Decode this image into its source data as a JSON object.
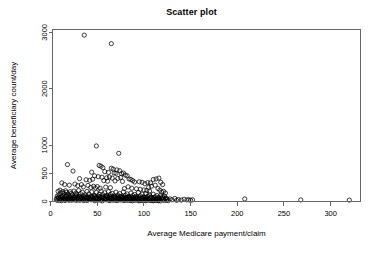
{
  "chart_data": {
    "type": "scatter",
    "title": "Scatter plot",
    "xlabel": "Average Medicare payment/claim",
    "ylabel": "Average beneficiary count/day",
    "xlim": [
      2,
      332
    ],
    "ylim": [
      0,
      3050
    ],
    "xticks": [
      0,
      50,
      100,
      150,
      200,
      250,
      300
    ],
    "xtick_labels": [
      "0",
      "50",
      "100",
      "150",
      "200",
      "250",
      "300"
    ],
    "yticks": [
      0,
      500,
      1000,
      2000,
      3000
    ],
    "ytick_labels": [
      "0",
      "500",
      "1000",
      "2000",
      "3000"
    ],
    "grid": false,
    "legend": null,
    "marker": "open-circle",
    "marker_color": "#000000",
    "marker_radius": 2.1,
    "points": [
      [
        36,
        2950
      ],
      [
        65,
        2800
      ],
      [
        49,
        985
      ],
      [
        73,
        855
      ],
      [
        18,
        655
      ],
      [
        52,
        640
      ],
      [
        54,
        625
      ],
      [
        56,
        600
      ],
      [
        65,
        590
      ],
      [
        67,
        575
      ],
      [
        71,
        560
      ],
      [
        74,
        545
      ],
      [
        24,
        540
      ],
      [
        44,
        520
      ],
      [
        58,
        530
      ],
      [
        62,
        515
      ],
      [
        68,
        505
      ],
      [
        70,
        500
      ],
      [
        76,
        495
      ],
      [
        78,
        505
      ],
      [
        80,
        470
      ],
      [
        82,
        455
      ],
      [
        47,
        455
      ],
      [
        51,
        440
      ],
      [
        55,
        430
      ],
      [
        60,
        420
      ],
      [
        63,
        435
      ],
      [
        66,
        415
      ],
      [
        72,
        410
      ],
      [
        75,
        425
      ],
      [
        84,
        400
      ],
      [
        86,
        390
      ],
      [
        31,
        405
      ],
      [
        38,
        385
      ],
      [
        42,
        375
      ],
      [
        45,
        395
      ],
      [
        57,
        370
      ],
      [
        61,
        360
      ],
      [
        69,
        365
      ],
      [
        77,
        355
      ],
      [
        88,
        370
      ],
      [
        90,
        345
      ],
      [
        95,
        350
      ],
      [
        98,
        340
      ],
      [
        104,
        335
      ],
      [
        110,
        390
      ],
      [
        113,
        400
      ],
      [
        116,
        415
      ],
      [
        107,
        330
      ],
      [
        101,
        315
      ],
      [
        118,
        340
      ],
      [
        120,
        300
      ],
      [
        112,
        290
      ],
      [
        108,
        270
      ],
      [
        105,
        250
      ],
      [
        115,
        230
      ],
      [
        117,
        200
      ],
      [
        121,
        180
      ],
      [
        123,
        150
      ],
      [
        119,
        165
      ],
      [
        12,
        330
      ],
      [
        15,
        300
      ],
      [
        20,
        290
      ],
      [
        26,
        310
      ],
      [
        29,
        280
      ],
      [
        33,
        300
      ],
      [
        35,
        260
      ],
      [
        40,
        285
      ],
      [
        43,
        250
      ],
      [
        46,
        270
      ],
      [
        48,
        240
      ],
      [
        50,
        265
      ],
      [
        53,
        235
      ],
      [
        59,
        255
      ],
      [
        64,
        245
      ],
      [
        79,
        230
      ],
      [
        83,
        260
      ],
      [
        87,
        235
      ],
      [
        92,
        225
      ],
      [
        96,
        215
      ],
      [
        100,
        205
      ],
      [
        103,
        195
      ],
      [
        106,
        185
      ],
      [
        8,
        180
      ],
      [
        10,
        200
      ],
      [
        11,
        155
      ],
      [
        13,
        175
      ],
      [
        14,
        140
      ],
      [
        16,
        190
      ],
      [
        17,
        160
      ],
      [
        19,
        130
      ],
      [
        21,
        175
      ],
      [
        22,
        145
      ],
      [
        23,
        120
      ],
      [
        25,
        185
      ],
      [
        27,
        150
      ],
      [
        28,
        125
      ],
      [
        30,
        195
      ],
      [
        32,
        140
      ],
      [
        34,
        165
      ],
      [
        37,
        115
      ],
      [
        39,
        180
      ],
      [
        41,
        135
      ],
      [
        44,
        170
      ],
      [
        47,
        110
      ],
      [
        49,
        160
      ],
      [
        52,
        130
      ],
      [
        54,
        185
      ],
      [
        56,
        120
      ],
      [
        58,
        155
      ],
      [
        60,
        105
      ],
      [
        62,
        175
      ],
      [
        64,
        125
      ],
      [
        66,
        145
      ],
      [
        68,
        100
      ],
      [
        70,
        165
      ],
      [
        72,
        115
      ],
      [
        74,
        140
      ],
      [
        76,
        95
      ],
      [
        78,
        170
      ],
      [
        80,
        110
      ],
      [
        82,
        135
      ],
      [
        84,
        90
      ],
      [
        86,
        150
      ],
      [
        88,
        105
      ],
      [
        90,
        125
      ],
      [
        92,
        85
      ],
      [
        94,
        160
      ],
      [
        96,
        100
      ],
      [
        98,
        130
      ],
      [
        100,
        80
      ],
      [
        102,
        140
      ],
      [
        104,
        95
      ],
      [
        106,
        115
      ],
      [
        108,
        75
      ],
      [
        110,
        130
      ],
      [
        112,
        85
      ],
      [
        114,
        105
      ],
      [
        116,
        70
      ],
      [
        118,
        110
      ],
      [
        120,
        80
      ],
      [
        122,
        95
      ],
      [
        124,
        60
      ],
      [
        7,
        95
      ],
      [
        8,
        60
      ],
      [
        9,
        120
      ],
      [
        10,
        45
      ],
      [
        11,
        80
      ],
      [
        12,
        35
      ],
      [
        13,
        100
      ],
      [
        14,
        55
      ],
      [
        15,
        70
      ],
      [
        16,
        30
      ],
      [
        17,
        110
      ],
      [
        18,
        50
      ],
      [
        19,
        85
      ],
      [
        20,
        40
      ],
      [
        21,
        65
      ],
      [
        22,
        25
      ],
      [
        23,
        95
      ],
      [
        24,
        55
      ],
      [
        25,
        75
      ],
      [
        26,
        35
      ],
      [
        27,
        105
      ],
      [
        28,
        45
      ],
      [
        29,
        70
      ],
      [
        30,
        28
      ],
      [
        31,
        90
      ],
      [
        32,
        52
      ],
      [
        33,
        68
      ],
      [
        34,
        32
      ],
      [
        35,
        98
      ],
      [
        36,
        42
      ],
      [
        37,
        72
      ],
      [
        38,
        26
      ],
      [
        39,
        86
      ],
      [
        40,
        56
      ],
      [
        41,
        64
      ],
      [
        42,
        36
      ],
      [
        43,
        92
      ],
      [
        44,
        46
      ],
      [
        45,
        76
      ],
      [
        46,
        30
      ],
      [
        47,
        88
      ],
      [
        48,
        58
      ],
      [
        49,
        66
      ],
      [
        50,
        38
      ],
      [
        51,
        94
      ],
      [
        52,
        48
      ],
      [
        53,
        74
      ],
      [
        54,
        28
      ],
      [
        55,
        84
      ],
      [
        56,
        54
      ],
      [
        57,
        62
      ],
      [
        58,
        34
      ],
      [
        59,
        90
      ],
      [
        60,
        44
      ],
      [
        61,
        78
      ],
      [
        62,
        24
      ],
      [
        63,
        82
      ],
      [
        64,
        52
      ],
      [
        65,
        60
      ],
      [
        66,
        32
      ],
      [
        67,
        88
      ],
      [
        68,
        42
      ],
      [
        69,
        70
      ],
      [
        70,
        22
      ],
      [
        71,
        80
      ],
      [
        72,
        50
      ],
      [
        73,
        58
      ],
      [
        74,
        30
      ],
      [
        75,
        86
      ],
      [
        76,
        40
      ],
      [
        77,
        68
      ],
      [
        78,
        20
      ],
      [
        79,
        78
      ],
      [
        80,
        48
      ],
      [
        81,
        56
      ],
      [
        82,
        28
      ],
      [
        83,
        84
      ],
      [
        84,
        38
      ],
      [
        85,
        66
      ],
      [
        86,
        18
      ],
      [
        87,
        76
      ],
      [
        88,
        46
      ],
      [
        89,
        54
      ],
      [
        90,
        26
      ],
      [
        91,
        82
      ],
      [
        92,
        36
      ],
      [
        93,
        64
      ],
      [
        94,
        16
      ],
      [
        95,
        74
      ],
      [
        96,
        44
      ],
      [
        97,
        52
      ],
      [
        98,
        24
      ],
      [
        99,
        80
      ],
      [
        100,
        34
      ],
      [
        101,
        62
      ],
      [
        102,
        14
      ],
      [
        103,
        72
      ],
      [
        104,
        42
      ],
      [
        105,
        50
      ],
      [
        106,
        22
      ],
      [
        107,
        78
      ],
      [
        108,
        32
      ],
      [
        109,
        60
      ],
      [
        110,
        12
      ],
      [
        111,
        70
      ],
      [
        112,
        40
      ],
      [
        113,
        48
      ],
      [
        114,
        20
      ],
      [
        115,
        66
      ],
      [
        116,
        30
      ],
      [
        117,
        56
      ],
      [
        118,
        10
      ],
      [
        119,
        62
      ],
      [
        120,
        36
      ],
      [
        121,
        44
      ],
      [
        122,
        18
      ],
      [
        123,
        52
      ],
      [
        124,
        26
      ],
      [
        125,
        40
      ],
      [
        126,
        14
      ],
      [
        6,
        30
      ],
      [
        6.5,
        55
      ],
      [
        7.5,
        20
      ],
      [
        8.5,
        75
      ],
      [
        9.5,
        25
      ],
      [
        10.5,
        65
      ],
      [
        11.5,
        15
      ],
      [
        12.5,
        88
      ],
      [
        13.5,
        33
      ],
      [
        14.5,
        48
      ],
      [
        15.5,
        18
      ],
      [
        16.5,
        96
      ],
      [
        17.5,
        38
      ],
      [
        18.5,
        58
      ],
      [
        19.5,
        22
      ],
      [
        20.5,
        78
      ],
      [
        21.5,
        43
      ],
      [
        22.5,
        53
      ],
      [
        23.5,
        27
      ],
      [
        24.5,
        68
      ],
      [
        25.5,
        31
      ],
      [
        26.5,
        83
      ],
      [
        27.5,
        19
      ],
      [
        28.5,
        61
      ],
      [
        29.5,
        37
      ],
      [
        30.5,
        91
      ],
      [
        31.5,
        23
      ],
      [
        32.5,
        71
      ],
      [
        33.5,
        41
      ],
      [
        34.5,
        59
      ],
      [
        35.5,
        17
      ],
      [
        36.5,
        81
      ],
      [
        37.5,
        35
      ],
      [
        38.5,
        63
      ],
      [
        39.5,
        21
      ],
      [
        40.5,
        73
      ],
      [
        41.5,
        45
      ],
      [
        42.5,
        51
      ],
      [
        43.5,
        29
      ],
      [
        44.5,
        85
      ],
      [
        45.5,
        39
      ],
      [
        46.5,
        57
      ],
      [
        47.5,
        13
      ],
      [
        48.5,
        67
      ],
      [
        49.5,
        47
      ],
      [
        50.5,
        49
      ],
      [
        51.5,
        25
      ],
      [
        52.5,
        87
      ],
      [
        53.5,
        33
      ],
      [
        54.5,
        69
      ],
      [
        55.5,
        11
      ],
      [
        56.5,
        77
      ],
      [
        57.5,
        41
      ],
      [
        58.5,
        55
      ],
      [
        59.5,
        29
      ],
      [
        60.5,
        79
      ],
      [
        61.5,
        37
      ],
      [
        62.5,
        65
      ],
      [
        63.5,
        15
      ],
      [
        64.5,
        89
      ],
      [
        65.5,
        43
      ],
      [
        66.5,
        53
      ],
      [
        67.5,
        23
      ],
      [
        68.5,
        75
      ],
      [
        69.5,
        35
      ],
      [
        70.5,
        61
      ],
      [
        71.5,
        17
      ],
      [
        72.5,
        83
      ],
      [
        73.5,
        45
      ],
      [
        74.5,
        51
      ],
      [
        75.5,
        27
      ],
      [
        76.5,
        71
      ],
      [
        77.5,
        39
      ],
      [
        78.5,
        59
      ],
      [
        79.5,
        19
      ],
      [
        80.5,
        73
      ],
      [
        81.5,
        31
      ],
      [
        82.5,
        63
      ],
      [
        83.5,
        21
      ],
      [
        84.5,
        67
      ],
      [
        85.5,
        47
      ],
      [
        86.5,
        49
      ],
      [
        87.5,
        13
      ],
      [
        88.5,
        69
      ],
      [
        89.5,
        33
      ],
      [
        90.5,
        57
      ],
      [
        91.5,
        25
      ],
      [
        92.5,
        61
      ],
      [
        93.5,
        37
      ],
      [
        94.5,
        45
      ],
      [
        95.5,
        15
      ],
      [
        96.5,
        55
      ],
      [
        97.5,
        29
      ],
      [
        98.5,
        51
      ],
      [
        99.5,
        19
      ],
      [
        100.5,
        59
      ],
      [
        101.5,
        31
      ],
      [
        102.5,
        43
      ],
      [
        103.5,
        23
      ],
      [
        104.5,
        47
      ],
      [
        105.5,
        35
      ],
      [
        106.5,
        39
      ],
      [
        107.5,
        17
      ],
      [
        108.5,
        41
      ],
      [
        109.5,
        27
      ],
      [
        110.5,
        33
      ],
      [
        111.5,
        21
      ],
      [
        112.5,
        37
      ],
      [
        113.5,
        25
      ],
      [
        114.5,
        29
      ],
      [
        115.5,
        13
      ],
      [
        116.5,
        31
      ],
      [
        128,
        45
      ],
      [
        130,
        30
      ],
      [
        133,
        55
      ],
      [
        135,
        20
      ],
      [
        137,
        35
      ],
      [
        140,
        25
      ],
      [
        143,
        40
      ],
      [
        146,
        28
      ],
      [
        148,
        32
      ],
      [
        150,
        22
      ],
      [
        152,
        30
      ],
      [
        208,
        45
      ],
      [
        268,
        28
      ],
      [
        320,
        25
      ]
    ]
  }
}
